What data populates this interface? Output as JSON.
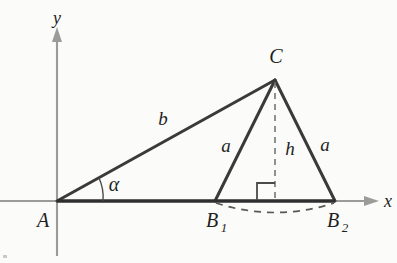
{
  "figure": {
    "background_color": "#fbfbf9",
    "ink_color": "#2f2f2f",
    "axis_color": "#9b9b99"
  },
  "axes": {
    "x_label": "x",
    "y_label": "y",
    "origin_label": "A"
  },
  "points": {
    "A": {
      "label": "A",
      "x": 57,
      "y": 201
    },
    "C": {
      "label": "C",
      "x": 275,
      "y": 80
    },
    "B1": {
      "label": "B",
      "subscript": "1",
      "x": 215,
      "y": 201
    },
    "B2": {
      "label": "B",
      "subscript": "2",
      "x": 335,
      "y": 201
    }
  },
  "segments": {
    "b_label": "b",
    "a_left_label": "a",
    "a_right_label": "a",
    "h_label": "h",
    "alpha_label": "α"
  },
  "markers": {
    "right_angle": "right-angle-square",
    "arc_b1_b2": "dashed-arc",
    "height_line": "dashed-height"
  }
}
